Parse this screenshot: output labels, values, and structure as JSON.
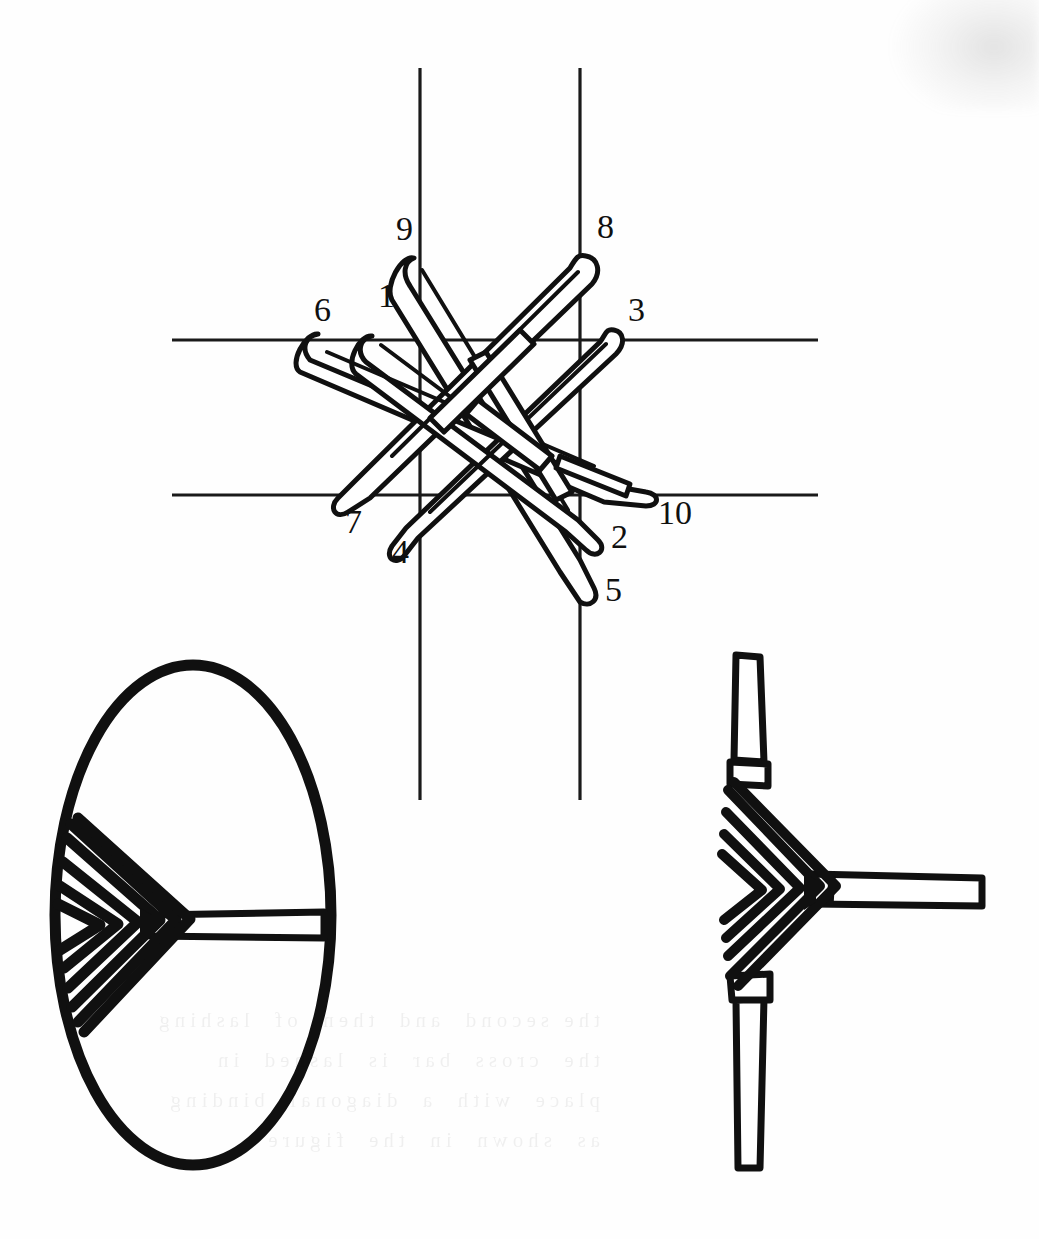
{
  "page": {
    "background_color": "#fefefe",
    "ink_color": "#101010",
    "width": 1039,
    "height": 1239
  },
  "figures": [
    {
      "id": "fig-weave",
      "name": "diagonal-lashing-weave-diagram",
      "caption": "",
      "description": "Ten numbered strand ends woven over and under around two vertical and two horizontal poles shown as thin guide lines."
    },
    {
      "id": "fig-hoop",
      "name": "hoop-with-lashed-crossbar",
      "caption": "",
      "description": "Bent-wood oval hoop with chevron lashing on the left side securing a horizontal crossbar."
    },
    {
      "id": "fig-tjoint",
      "name": "t-joint-chevron-lashing-detail",
      "caption": "",
      "description": "Detail of a vertical pole with chevron wrapping binding a horizontal arm in a T joint."
    }
  ],
  "weave_labels": [
    {
      "id": "1",
      "text": "1",
      "x": 378,
      "y": 307
    },
    {
      "id": "2",
      "text": "2",
      "x": 611,
      "y": 548
    },
    {
      "id": "3",
      "text": "3",
      "x": 628,
      "y": 321
    },
    {
      "id": "4",
      "text": "4",
      "x": 392,
      "y": 563
    },
    {
      "id": "5",
      "text": "5",
      "x": 605,
      "y": 601
    },
    {
      "id": "6",
      "text": "6",
      "x": 314,
      "y": 321
    },
    {
      "id": "7",
      "text": "7",
      "x": 345,
      "y": 533
    },
    {
      "id": "8",
      "text": "8",
      "x": 597,
      "y": 238
    },
    {
      "id": "9",
      "text": "9",
      "x": 396,
      "y": 240
    },
    {
      "id": "10",
      "text": "10",
      "x": 658,
      "y": 524
    }
  ],
  "guide_lines": {
    "vertical": [
      {
        "name": "pole-vertical-left",
        "x": 420,
        "y1": 68,
        "y2": 800
      },
      {
        "name": "pole-vertical-right",
        "x": 580,
        "y1": 68,
        "y2": 800
      }
    ],
    "horizontal": [
      {
        "name": "pole-horizontal-top",
        "y": 340,
        "x1": 172,
        "x2": 818
      },
      {
        "name": "pole-horizontal-bottom",
        "y": 495,
        "x1": 172,
        "x2": 818
      }
    ]
  },
  "hoop": {
    "name": "oval-hoop",
    "center_x": 193,
    "center_y": 915,
    "radius_x": 138,
    "radius_y": 250,
    "stroke_width": 11,
    "crossbar": {
      "name": "hoop-crossbar",
      "y": 925,
      "x_start": 148,
      "x_end": 325,
      "thickness": 17
    },
    "lashing_rows": 7
  },
  "tjoint": {
    "name": "t-joint",
    "vertical_pole": {
      "x_center": 748,
      "width": 26,
      "y_top": 655,
      "y_bottom": 1168
    },
    "horizontal_arm": {
      "y_center": 890,
      "thickness": 30,
      "x_start": 820,
      "x_end": 982
    },
    "lashing_rows": 6,
    "frapping_bands": 2
  },
  "ghost_text": "the second  and  then  of  lashing\nthe  cross  bar  is  lashed  in\nplace  with  a  diagonal  binding\nas  shown  in  the  figure"
}
